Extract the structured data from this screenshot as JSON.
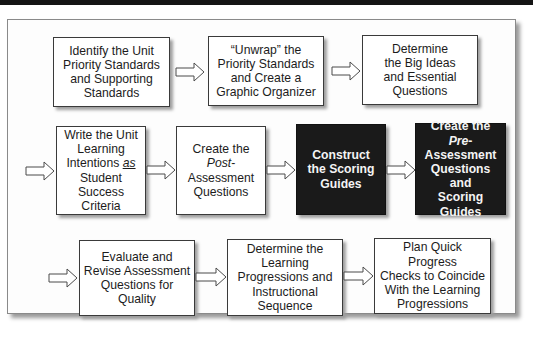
{
  "diagram": {
    "type": "flowchart",
    "rows": [
      {
        "steps": [
          {
            "id": 1,
            "lines": "Identify the Unit\nPriority Standards\nand Supporting\nStandards",
            "style": "light"
          },
          {
            "id": 2,
            "lines": "“Unwrap” the\nPriority Standards\nand Create a\nGraphic Organizer",
            "style": "light"
          },
          {
            "id": 3,
            "lines": "Determine\nthe Big Ideas\nand Essential\nQuestions",
            "style": "light"
          }
        ]
      },
      {
        "steps": [
          {
            "id": 4,
            "pre": "Write the Unit\nLearning\nIntentions ",
            "em": "as",
            "post": "\nStudent\nSuccess\nCriteria",
            "style": "light"
          },
          {
            "id": 5,
            "pre": "Create the\n",
            "em": "Post",
            "post": "-\nAssessment\nQuestions",
            "style": "light"
          },
          {
            "id": 6,
            "lines": "Construct\nthe Scoring\nGuides",
            "style": "dark"
          },
          {
            "id": 7,
            "pre": "Create the\n",
            "em": "Pre",
            "post": "-\nAssessment\nQuestions and\nScoring\nGuides",
            "style": "dark"
          }
        ]
      },
      {
        "steps": [
          {
            "id": 8,
            "lines": "Evaluate and\nRevise Assessment\nQuestions for\nQuality",
            "style": "light"
          },
          {
            "id": 9,
            "lines": "Determine the\nLearning\nProgressions and\nInstructional\nSequence",
            "style": "light"
          },
          {
            "id": 10,
            "lines": "Plan Quick Progress\nChecks to Coincide\nWith the Learning\nProgressions",
            "style": "light"
          }
        ]
      }
    ],
    "connections": [
      [
        1,
        2
      ],
      [
        2,
        3
      ],
      [
        3,
        4
      ],
      [
        4,
        5
      ],
      [
        5,
        6
      ],
      [
        6,
        7
      ],
      [
        7,
        8
      ],
      [
        8,
        9
      ],
      [
        9,
        10
      ]
    ],
    "colors": {
      "light_box_fill": "#ffffff",
      "dark_box_fill": "#1a1a1a",
      "border": "#3a3a3a",
      "arrow_outline": "#4a4a4a",
      "top_bar": "#141414"
    }
  }
}
